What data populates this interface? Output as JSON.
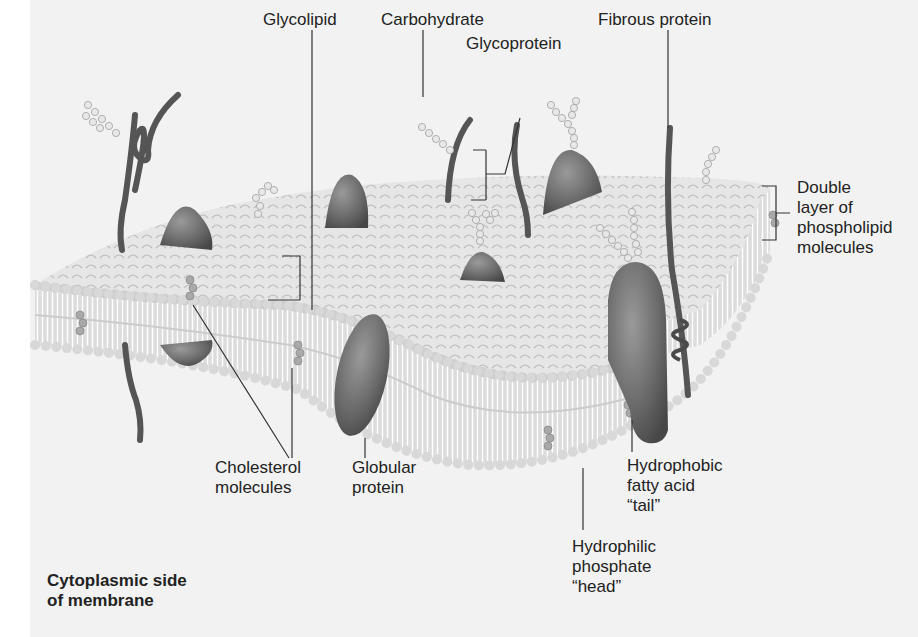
{
  "diagram": {
    "labels": {
      "glycolipid": "Glycolipid",
      "carbohydrate": "Carbohydrate",
      "glycoprotein": "Glycoprotein",
      "fibrous_protein": "Fibrous protein",
      "double_layer": [
        "Double",
        "layer of",
        "phospholipid",
        "molecules"
      ],
      "cholesterol": [
        "Cholesterol",
        "molecules"
      ],
      "globular_protein": [
        "Globular",
        "protein"
      ],
      "hydrophobic_tail": [
        "Hydrophobic",
        "fatty acid",
        "“tail”"
      ],
      "hydrophilic_head": [
        "Hydrophilic",
        "phosphate",
        "“head”"
      ],
      "cytoplasmic_side": [
        "Cytoplasmic side",
        "of membrane"
      ]
    },
    "colors": {
      "background": "#f2f2f2",
      "membrane_head": "#d9d9d9",
      "membrane_head_outline": "#b5b5b5",
      "tails": "#ffffff",
      "protein": "#6e6e6e",
      "protein_dark": "#4a4a4a",
      "leader_line": "#333333",
      "text": "#222222"
    }
  }
}
